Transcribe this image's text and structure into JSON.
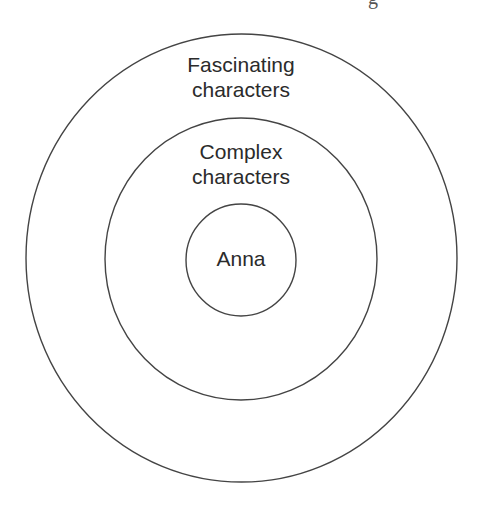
{
  "diagram": {
    "type": "concentric-circles",
    "stroke_color": "#444444",
    "rings": [
      {
        "id": "outer",
        "label_line1": "Fascinating",
        "label_line2": "characters",
        "cx": 241.5,
        "cy": 258,
        "rx": 215.5,
        "ry": 224
      },
      {
        "id": "middle",
        "label_line1": "Complex",
        "label_line2": "characters",
        "cx": 241,
        "cy": 259,
        "rx": 136,
        "ry": 141
      },
      {
        "id": "inner",
        "label": "Anna",
        "cx": 241,
        "cy": 260,
        "rx": 55,
        "ry": 56
      }
    ]
  },
  "top_clipped_text": "g"
}
